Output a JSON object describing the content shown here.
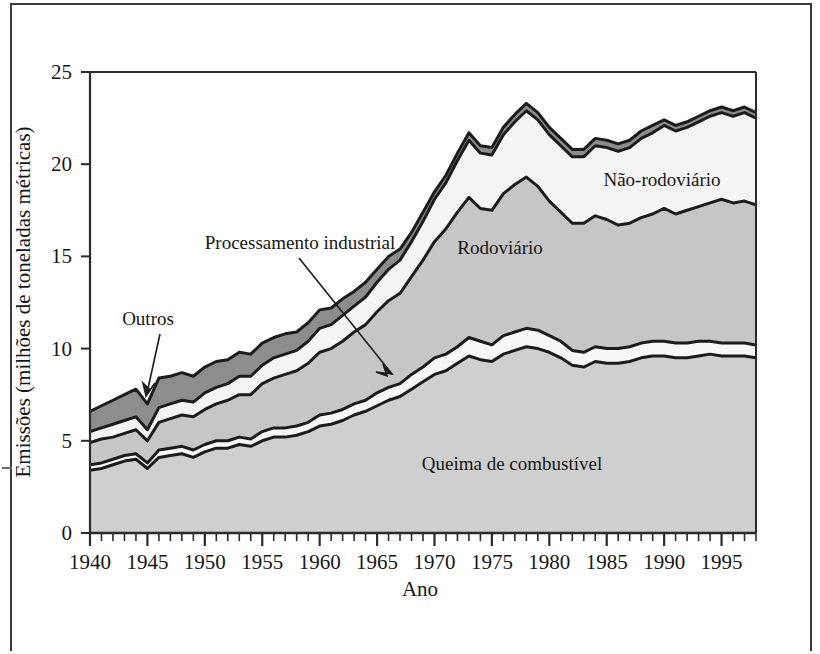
{
  "figure": {
    "axis": {
      "x_title": "Ano",
      "y_title": "Emissões (milhões de toneladas métricas)",
      "y_ticks": [
        "0",
        "5",
        "10",
        "15",
        "20",
        "25"
      ],
      "x_ticks": [
        "1940",
        "1945",
        "1950",
        "1955",
        "1960",
        "1965",
        "1970",
        "1975",
        "1980",
        "1985",
        "1990",
        "1995"
      ]
    },
    "labels": {
      "nao_rodoviario": "Não-rodoviário",
      "rodoviario": "Rodoviário",
      "queima": "Queima de combustível",
      "processamento": "Processamento industrial",
      "outros": "Outros"
    },
    "colors": {
      "queima_fill": "#cfcfcf",
      "processamento_fill": "#f7f7f7",
      "rodoviario_fill": "#c6c6c6",
      "nao_rodoviario_fill": "#f4f4f4",
      "outros_fill": "#8d8d8d",
      "line": "#1c1c1c",
      "axis": "#2b2b2b",
      "page_border": "#3b3b3b"
    }
  },
  "chart_data": {
    "type": "area",
    "title": "",
    "xlabel": "Ano",
    "ylabel": "Emissões (milhões de toneladas métricas)",
    "xlim": [
      1940,
      1998
    ],
    "ylim": [
      0,
      25
    ],
    "grid": false,
    "stacked": true,
    "legend": "in-plot annotations",
    "x": [
      1940,
      1941,
      1942,
      1943,
      1944,
      1945,
      1946,
      1947,
      1948,
      1949,
      1950,
      1951,
      1952,
      1953,
      1954,
      1955,
      1956,
      1957,
      1958,
      1959,
      1960,
      1961,
      1962,
      1963,
      1964,
      1965,
      1966,
      1967,
      1968,
      1969,
      1970,
      1971,
      1972,
      1973,
      1974,
      1975,
      1976,
      1977,
      1978,
      1979,
      1980,
      1981,
      1982,
      1983,
      1984,
      1985,
      1986,
      1987,
      1988,
      1989,
      1990,
      1991,
      1992,
      1993,
      1994,
      1995,
      1996,
      1997,
      1998
    ],
    "series": [
      {
        "name": "Queima de combustível",
        "values": [
          3.4,
          3.5,
          3.7,
          3.9,
          4.0,
          3.5,
          4.1,
          4.2,
          4.3,
          4.1,
          4.4,
          4.6,
          4.6,
          4.8,
          4.7,
          5.0,
          5.2,
          5.2,
          5.3,
          5.5,
          5.8,
          5.9,
          6.1,
          6.4,
          6.6,
          6.9,
          7.2,
          7.4,
          7.8,
          8.2,
          8.6,
          8.8,
          9.2,
          9.6,
          9.4,
          9.3,
          9.7,
          9.9,
          10.1,
          10.0,
          9.8,
          9.5,
          9.1,
          9.0,
          9.3,
          9.2,
          9.2,
          9.3,
          9.5,
          9.6,
          9.6,
          9.5,
          9.5,
          9.6,
          9.7,
          9.6,
          9.6,
          9.6,
          9.5
        ]
      },
      {
        "name": "Processamento industrial",
        "values": [
          0.3,
          0.3,
          0.3,
          0.3,
          0.3,
          0.3,
          0.4,
          0.4,
          0.4,
          0.4,
          0.4,
          0.4,
          0.4,
          0.4,
          0.4,
          0.5,
          0.5,
          0.5,
          0.5,
          0.5,
          0.6,
          0.6,
          0.6,
          0.6,
          0.6,
          0.7,
          0.7,
          0.7,
          0.8,
          0.8,
          0.9,
          0.9,
          0.9,
          1.0,
          1.0,
          0.9,
          1.0,
          1.0,
          1.0,
          1.0,
          0.9,
          0.9,
          0.8,
          0.8,
          0.8,
          0.8,
          0.8,
          0.8,
          0.8,
          0.8,
          0.8,
          0.8,
          0.8,
          0.8,
          0.7,
          0.7,
          0.7,
          0.7,
          0.7
        ]
      },
      {
        "name": "Rodoviário",
        "values": [
          1.2,
          1.3,
          1.2,
          1.2,
          1.3,
          1.2,
          1.5,
          1.6,
          1.7,
          1.8,
          1.9,
          2.0,
          2.2,
          2.3,
          2.4,
          2.6,
          2.7,
          2.9,
          3.0,
          3.2,
          3.4,
          3.5,
          3.7,
          3.9,
          4.1,
          4.4,
          4.7,
          4.9,
          5.3,
          5.8,
          6.3,
          6.8,
          7.3,
          7.6,
          7.2,
          7.3,
          7.7,
          8.0,
          8.2,
          7.8,
          7.3,
          7.0,
          6.9,
          7.0,
          7.1,
          7.0,
          6.7,
          6.7,
          6.8,
          6.9,
          7.2,
          7.0,
          7.2,
          7.3,
          7.5,
          7.8,
          7.6,
          7.7,
          7.6
        ]
      },
      {
        "name": "Não-rodoviário",
        "values": [
          0.6,
          0.6,
          0.7,
          0.7,
          0.7,
          0.6,
          0.8,
          0.8,
          0.8,
          0.8,
          0.9,
          0.9,
          0.9,
          1.0,
          1.0,
          1.0,
          1.1,
          1.1,
          1.1,
          1.2,
          1.3,
          1.3,
          1.4,
          1.4,
          1.5,
          1.6,
          1.7,
          1.8,
          1.9,
          2.1,
          2.3,
          2.5,
          2.8,
          3.1,
          3.0,
          3.0,
          3.2,
          3.4,
          3.6,
          3.6,
          3.6,
          3.6,
          3.6,
          3.6,
          3.8,
          3.9,
          4.0,
          4.1,
          4.3,
          4.4,
          4.5,
          4.5,
          4.5,
          4.6,
          4.7,
          4.7,
          4.7,
          4.8,
          4.7
        ]
      },
      {
        "name": "Outros",
        "values": [
          1.1,
          1.2,
          1.3,
          1.4,
          1.5,
          1.4,
          1.6,
          1.5,
          1.5,
          1.4,
          1.4,
          1.4,
          1.3,
          1.3,
          1.2,
          1.2,
          1.1,
          1.1,
          1.0,
          1.0,
          1.0,
          0.9,
          0.9,
          0.8,
          0.8,
          0.7,
          0.7,
          0.6,
          0.5,
          0.5,
          0.4,
          0.4,
          0.4,
          0.4,
          0.4,
          0.4,
          0.4,
          0.4,
          0.4,
          0.4,
          0.4,
          0.4,
          0.4,
          0.4,
          0.4,
          0.4,
          0.4,
          0.4,
          0.4,
          0.4,
          0.3,
          0.3,
          0.3,
          0.3,
          0.3,
          0.3,
          0.3,
          0.3,
          0.3
        ]
      }
    ]
  }
}
